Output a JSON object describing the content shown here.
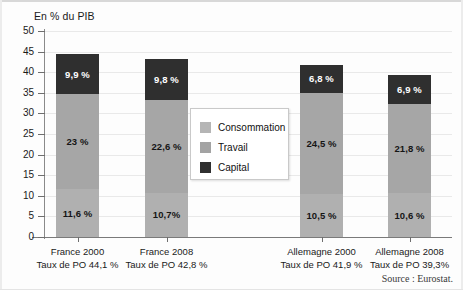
{
  "axis_title": "En % du PIB",
  "source_note": "Source : Eurostat.",
  "legend": {
    "items": [
      {
        "label": "Consommation",
        "color": "#b5b5b5",
        "swatch_name": "legend-swatch-consommation"
      },
      {
        "label": "Travail",
        "color": "#a3a3a3",
        "swatch_name": "legend-swatch-travail"
      },
      {
        "label": "Capital",
        "color": "#2f2f2f",
        "swatch_name": "legend-swatch-capital"
      }
    ]
  },
  "yticks": [
    "0",
    "5",
    "10",
    "15",
    "20",
    "25",
    "30",
    "35",
    "40",
    "45",
    "50"
  ],
  "bars": [
    {
      "country_year": "France 2000",
      "rate_line": "Taux de PO 44,1 %",
      "consommation_label": "11,6 %",
      "travail_label": "23 %",
      "capital_label": "9,9 %"
    },
    {
      "country_year": "France 2008",
      "rate_line": "Taux de PO 42,8 %",
      "consommation_label": "10,7%",
      "travail_label": "22,6 %",
      "capital_label": "9,8 %"
    },
    {
      "country_year": "Allemagne 2000",
      "rate_line": "Taux de PO 41,9 %",
      "consommation_label": "10,5 %",
      "travail_label": "24,5 %",
      "capital_label": "6,8 %"
    },
    {
      "country_year": "Allemagne 2008",
      "rate_line": "Taux de PO 39,3%",
      "consommation_label": "10,6 %",
      "travail_label": "21,8 %",
      "capital_label": "6,9 %"
    }
  ],
  "chart_data": {
    "type": "bar",
    "subtype": "stacked-column",
    "title": "",
    "ylabel": "En % du PIB",
    "xlabel": "",
    "ylim": [
      0,
      50
    ],
    "ytick_step": 5,
    "grid": true,
    "legend_position": "inside-center",
    "categories": [
      "France 2000",
      "France 2008",
      "Allemagne 2000",
      "Allemagne 2008"
    ],
    "category_sublabels": [
      "Taux de PO 44,1 %",
      "Taux de PO 42,8 %",
      "Taux de PO 41,9 %",
      "Taux de PO 39,3%"
    ],
    "series": [
      {
        "name": "Consommation",
        "color": "#b0b0b0",
        "values": [
          11.6,
          10.7,
          10.5,
          10.6
        ],
        "data_labels": [
          "11,6 %",
          "10,7%",
          "10,5 %",
          "10,6 %"
        ]
      },
      {
        "name": "Travail",
        "color": "#a6a6a6",
        "values": [
          23.0,
          22.6,
          24.5,
          21.8
        ],
        "data_labels": [
          "23 %",
          "22,6 %",
          "24,5 %",
          "21,8 %"
        ]
      },
      {
        "name": "Capital",
        "color": "#2f2f2f",
        "values": [
          9.9,
          9.8,
          6.8,
          6.9
        ],
        "data_labels": [
          "9,9 %",
          "9,8 %",
          "6,8 %",
          "6,9 %"
        ]
      }
    ],
    "totals": [
      44.5,
      43.1,
      41.8,
      39.3
    ],
    "annotations": [
      "Source : Eurostat."
    ]
  }
}
